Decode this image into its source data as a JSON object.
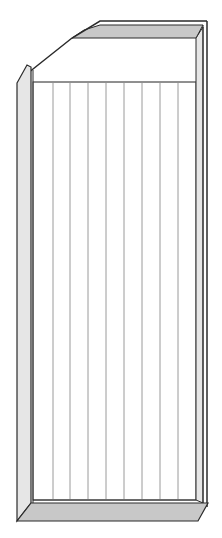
{
  "diagram": {
    "title": "",
    "colors": {
      "stroke": "#2b2b2b",
      "band_fill": "#c8c8c8",
      "wall_fill": "#e6e6e6",
      "slat_line": "#9a9a9a",
      "background": "#ffffff"
    },
    "slat_x": [
      53,
      70,
      88,
      106,
      124,
      142,
      160,
      178
    ]
  }
}
